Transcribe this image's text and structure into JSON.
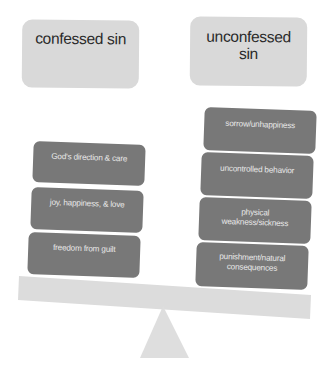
{
  "headers": {
    "left": "confessed sin",
    "right": "unconfessed sin"
  },
  "left_items": [
    "God's direction & care",
    "joy, happiness, & love",
    "freedom from guilt"
  ],
  "right_items": [
    "sorrow/unhappiness",
    "uncontrolled behavior",
    "physical weakness/sickness",
    "punishment/natural consequences"
  ],
  "colors": {
    "light_box": "#d9d9d9",
    "dark_box": "#787878",
    "beam": "#dcdcdc",
    "fulcrum": "#dedede"
  }
}
